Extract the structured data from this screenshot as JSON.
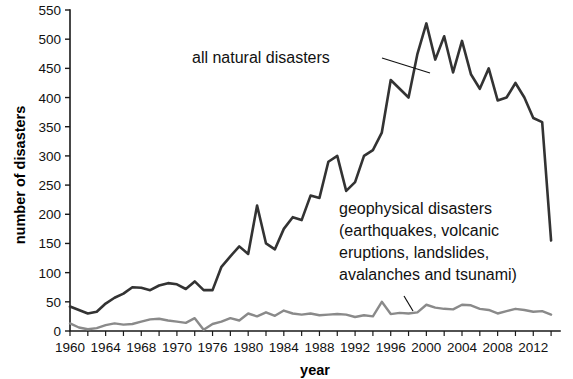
{
  "chart_data": {
    "type": "line",
    "title": "",
    "xlabel": "year",
    "ylabel": "number of disasters",
    "xlim": [
      1960,
      2015
    ],
    "ylim": [
      0,
      550
    ],
    "grid": false,
    "legend_position": "inline-annotations",
    "yticks": [
      0,
      50,
      100,
      150,
      200,
      250,
      300,
      350,
      400,
      450,
      500,
      550
    ],
    "ytick_labels": [
      "0",
      "50",
      "100",
      "150",
      "200",
      "250",
      "300",
      "350",
      "400",
      "450",
      "500",
      "550"
    ],
    "xticks": [
      1960,
      1964,
      1968,
      1972,
      1976,
      1980,
      1984,
      1988,
      1992,
      1996,
      2000,
      2004,
      2008,
      2012
    ],
    "xtick_labels": [
      "1960",
      "1964",
      "1968",
      "1970",
      "1976",
      "1980",
      "1984",
      "1988",
      "1992",
      "1996",
      "2000",
      "2004",
      "2008",
      "2012"
    ],
    "xtick_minor_step": 2,
    "x": [
      1960,
      1961,
      1962,
      1963,
      1964,
      1965,
      1966,
      1967,
      1968,
      1969,
      1970,
      1971,
      1972,
      1973,
      1974,
      1975,
      1976,
      1977,
      1978,
      1979,
      1980,
      1981,
      1982,
      1983,
      1984,
      1985,
      1986,
      1987,
      1988,
      1989,
      1990,
      1991,
      1992,
      1993,
      1994,
      1995,
      1996,
      1997,
      1998,
      1999,
      2000,
      2001,
      2002,
      2003,
      2004,
      2005,
      2006,
      2007,
      2008,
      2009,
      2010,
      2011,
      2012,
      2013,
      2014
    ],
    "series": [
      {
        "name": "all natural disasters",
        "color": "#333333",
        "values": [
          42,
          36,
          30,
          33,
          47,
          57,
          64,
          75,
          74,
          70,
          78,
          82,
          80,
          72,
          85,
          70,
          70,
          110,
          128,
          145,
          132,
          215,
          150,
          140,
          175,
          195,
          190,
          232,
          228,
          290,
          300,
          240,
          255,
          300,
          310,
          340,
          430,
          415,
          400,
          475,
          527,
          465,
          505,
          443,
          497,
          440,
          415,
          450,
          395,
          400,
          425,
          400,
          365,
          358,
          155
        ]
      },
      {
        "name": "geophysical disasters",
        "color": "#8a8a8a",
        "values": [
          13,
          6,
          3,
          5,
          10,
          13,
          11,
          12,
          16,
          20,
          21,
          18,
          16,
          14,
          22,
          2,
          12,
          16,
          22,
          18,
          30,
          25,
          32,
          26,
          35,
          30,
          28,
          30,
          27,
          28,
          29,
          28,
          24,
          27,
          25,
          50,
          29,
          31,
          30,
          32,
          45,
          40,
          38,
          37,
          45,
          44,
          38,
          36,
          30,
          34,
          38,
          36,
          33,
          34,
          28
        ]
      }
    ],
    "annotations": [
      {
        "id": "all-natural-disasters-label",
        "lines": [
          "all natural disasters"
        ],
        "x": 192,
        "y": 63,
        "leader": {
          "x1": 382,
          "y1": 58,
          "x2": 430,
          "y2": 73
        }
      },
      {
        "id": "geophysical-disasters-label",
        "lines": [
          "geophysical disasters",
          "(earthquakes, volcanic",
          "eruptions, landslides,",
          "avalanches and tsunami)"
        ],
        "x": 339,
        "y": 214,
        "line_height": 22,
        "leader": {
          "x1": 404,
          "y1": 296,
          "x2": 413,
          "y2": 311
        }
      }
    ]
  },
  "colors": {
    "background": "#ffffff",
    "axis": "#1a1a1a",
    "text": "#111111",
    "series_all_natural": "#333333",
    "series_geophysical": "#8a8a8a"
  }
}
